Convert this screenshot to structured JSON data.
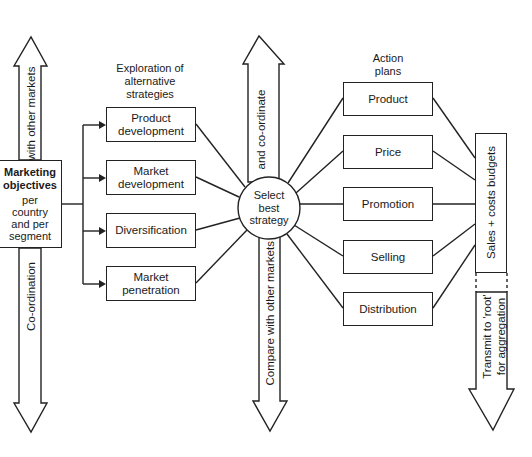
{
  "diagram": {
    "objectives": {
      "title": "Marketing objectives",
      "sub": "per country and per segment"
    },
    "left_arrow": {
      "up_label": "with other markets",
      "down_label": "Co-ordination"
    },
    "exploration_heading": "Exploration of alternative strategies",
    "strategies": [
      {
        "label": "Product development"
      },
      {
        "label": "Market development"
      },
      {
        "label": "Diversification"
      },
      {
        "label": "Market penetration"
      }
    ],
    "center": {
      "label": "Select best strategy"
    },
    "middle_arrow": {
      "up_label": "and co-ordinate",
      "down_label": "Compare with other markets"
    },
    "action_heading": "Action plans",
    "actions": [
      {
        "label": "Product"
      },
      {
        "label": "Price"
      },
      {
        "label": "Promotion"
      },
      {
        "label": "Selling"
      },
      {
        "label": "Distribution"
      }
    ],
    "budget_box": {
      "label": "Sales + costs budgets"
    },
    "right_arrow": {
      "label_line1": "Transmit to 'root'",
      "label_line2": "for aggregation"
    }
  }
}
